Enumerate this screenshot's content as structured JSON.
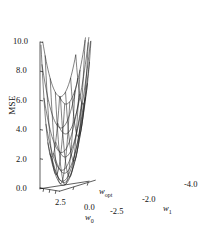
{
  "figure": {
    "kind": "3d-surface-wireframe",
    "background": "#ffffff",
    "line_color": "#1a1a1a",
    "width": 215,
    "height": 227
  },
  "chart_data": {
    "type": "line",
    "render": "surface3d-wireframe",
    "title": "",
    "subtitle": "",
    "xlabel": "w0",
    "ylabel": "w1",
    "zlabel": "MSE",
    "grid": false,
    "legend": null,
    "annotations": [
      {
        "text": "w_opt",
        "meaning": "location of minimum MSE",
        "x": 0.0,
        "y": -2.0,
        "z": 0.0
      }
    ],
    "zlim": [
      0.0,
      10.0
    ],
    "z_ticks": [
      0.0,
      2.0,
      4.0,
      6.0,
      8.0,
      10.0
    ],
    "z_tick_labels": [
      "0.0",
      "2.0",
      "4.0",
      "6.0",
      "8.0",
      "10.0"
    ],
    "x_ticks": [
      2.5,
      0.0,
      -2.5
    ],
    "x_tick_labels": [
      "2.5",
      "0.0",
      "-2.5"
    ],
    "xlim": [
      4.0,
      -4.0
    ],
    "y_ticks": [
      -2.0,
      -4.0
    ],
    "y_tick_labels": [
      "-2.0",
      "-4.0"
    ],
    "ylim": [
      0.0,
      -5.0
    ],
    "surface": {
      "formula": "MSE = a*(w0 - w0opt)^2 + b*(w1 - w1opt)^2 + c*(w0 - w0opt)*(w1 - w1opt)",
      "a": 0.4,
      "b": 0.62,
      "c": 0.3,
      "w0_opt": 0.0,
      "w1_opt": -2.0,
      "mse_min": 0.0,
      "mesh_w0_lines": 11,
      "mesh_w1_lines": 8
    }
  },
  "axes": {
    "z": {
      "name": "MSE",
      "ticks": [
        "10.0",
        "8.0",
        "6.0",
        "4.0",
        "2.0",
        "0.0"
      ]
    },
    "x": {
      "name_main": "w",
      "name_sub": "0",
      "ticks": [
        "2.5",
        "0.0",
        "-2.5"
      ]
    },
    "y": {
      "name_main": "w",
      "name_sub": "1",
      "ticks": [
        "-2.0",
        "-4.0"
      ]
    }
  },
  "optimum": {
    "label_main": "w",
    "label_sub": "opt"
  }
}
